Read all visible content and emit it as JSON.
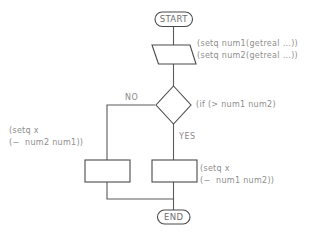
{
  "diagram": {
    "colors": {
      "background": "#ffffff",
      "shape_stroke": "#4a4a4a",
      "connector": "#5a5a5a",
      "label_text": "#6e6e6e",
      "annotation_text": "#8e8e8e",
      "branch_text": "#8a8a8a"
    },
    "nodes": {
      "start": {
        "shape": "terminator",
        "label": "START"
      },
      "input": {
        "shape": "parallelogram",
        "label": ""
      },
      "decision": {
        "shape": "diamond",
        "label": ""
      },
      "process_false": {
        "shape": "rectangle",
        "label": ""
      },
      "process_true": {
        "shape": "rectangle",
        "label": ""
      },
      "end": {
        "shape": "terminator",
        "label": "END"
      }
    },
    "branch_labels": {
      "no": "NO",
      "yes": "YES"
    },
    "annotations": {
      "input": "(setq num1(getreal ...))\n(setq num2(getreal ...))",
      "condition": "(if (> num1 num2)",
      "false_branch": "(setq x\n(−  num2 num1))",
      "true_branch": "(setq x\n(−  num1 num2))"
    }
  }
}
